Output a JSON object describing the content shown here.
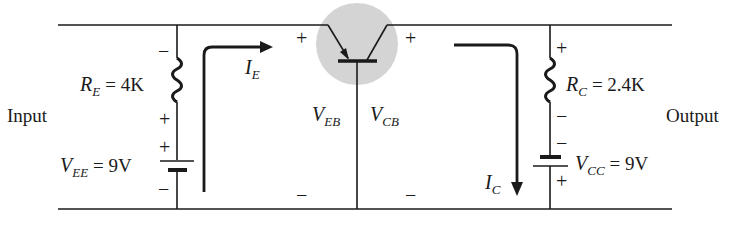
{
  "diagram": {
    "type": "common-base BJT (pnp) circuit",
    "labels": {
      "input": "Input",
      "output": "Output"
    },
    "emitter_resistor": {
      "symbol": "R",
      "subscript": "E",
      "value_text": "= 4K"
    },
    "collector_resistor": {
      "symbol": "R",
      "subscript": "C",
      "value_text": "= 2.4K"
    },
    "emitter_supply": {
      "symbol": "V",
      "subscript": "EE",
      "value_text": "= 9V"
    },
    "collector_supply": {
      "symbol": "V",
      "subscript": "CC",
      "value_text": "= 9V"
    },
    "emitter_current": {
      "symbol": "I",
      "subscript": "E"
    },
    "collector_current": {
      "symbol": "I",
      "subscript": "C"
    },
    "v_eb": {
      "symbol": "V",
      "subscript": "EB"
    },
    "v_cb": {
      "symbol": "V",
      "subscript": "CB"
    },
    "polarity": {
      "plus": "+",
      "minus": "−"
    },
    "colors": {
      "line": "#1a1a1a",
      "transistor_highlight": "#d4d4d4",
      "background": "#ffffff"
    }
  }
}
